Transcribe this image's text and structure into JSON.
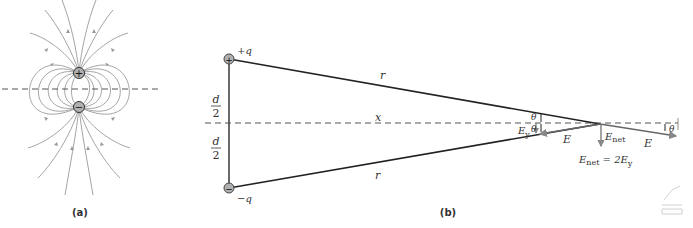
{
  "panel_a": {
    "caption": "(a)",
    "positive_charge_symbol": "+",
    "negative_charge_symbol": "−"
  },
  "panel_b": {
    "caption": "(b)",
    "positive_charge_label": "+q",
    "negative_charge_label": "−q",
    "positive_charge_symbol": "+",
    "negative_charge_symbol": "−",
    "half_separation_numerator": "d",
    "half_separation_denominator": "2",
    "distance_top": "r",
    "distance_bottom": "r",
    "axis_distance": "x",
    "theta_upper": "θ",
    "theta_lower": "θ",
    "theta_right": "θ",
    "field_component_y": "E",
    "field_component_y_sub": "y",
    "field_left": "E",
    "field_right": "E",
    "net_field": "E",
    "net_field_sub": "net",
    "equation_lhs": "E",
    "equation_lhs_sub": "net",
    "equation_rhs": " = 2E",
    "equation_rhs_sub": "y"
  },
  "colors": {
    "field_lines": "#9a9a9a",
    "lines": "#222222",
    "dashed": "#555555",
    "charge_fill": "#b0b0b0",
    "text": "#333333"
  }
}
